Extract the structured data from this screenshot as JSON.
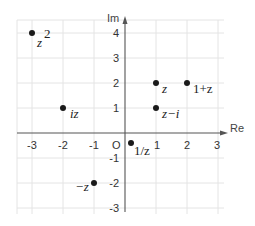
{
  "figure": {
    "origin_label": "O",
    "x_axis_label": "Re",
    "y_axis_label": "Im",
    "x_ticks": [
      "-3",
      "-2",
      "-1",
      "1",
      "2",
      "3"
    ],
    "y_ticks": [
      "4",
      "3",
      "2",
      "1",
      "-1",
      "-2",
      "-3"
    ]
  },
  "points": [
    {
      "name": "z",
      "label": "z",
      "re": 1,
      "im": 2
    },
    {
      "name": "1+z",
      "label": "1+z",
      "re": 2,
      "im": 2
    },
    {
      "name": "z-i",
      "label": "z−i",
      "re": 1,
      "im": 1
    },
    {
      "name": "iz",
      "label": "iz",
      "re": -2,
      "im": 1
    },
    {
      "name": "-z",
      "label": "−z",
      "re": -1,
      "im": -2
    },
    {
      "name": "1/z",
      "label": "1/z",
      "re": 0.2,
      "im": -0.4
    },
    {
      "name": "z^2",
      "label": "z",
      "sup": "2",
      "re": -3,
      "im": 4
    }
  ],
  "colors": {
    "grid": "#e4e4e4",
    "axis": "#555555",
    "dot": "#1a1a1a",
    "text": "#222222"
  }
}
